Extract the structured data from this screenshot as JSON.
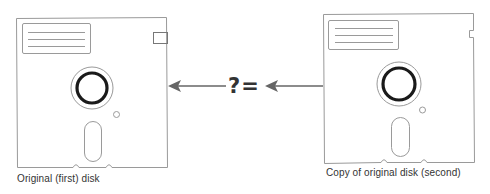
{
  "diagram": {
    "left_disk": {
      "caption": "Original (first) disk"
    },
    "right_disk": {
      "caption": "Copy of original disk (second)"
    },
    "comparison_operator": "?=",
    "colors": {
      "outline": "#9a9a9a",
      "hub_ring": "#1a1a1a",
      "arrow": "#666666",
      "text": "#333333"
    }
  }
}
